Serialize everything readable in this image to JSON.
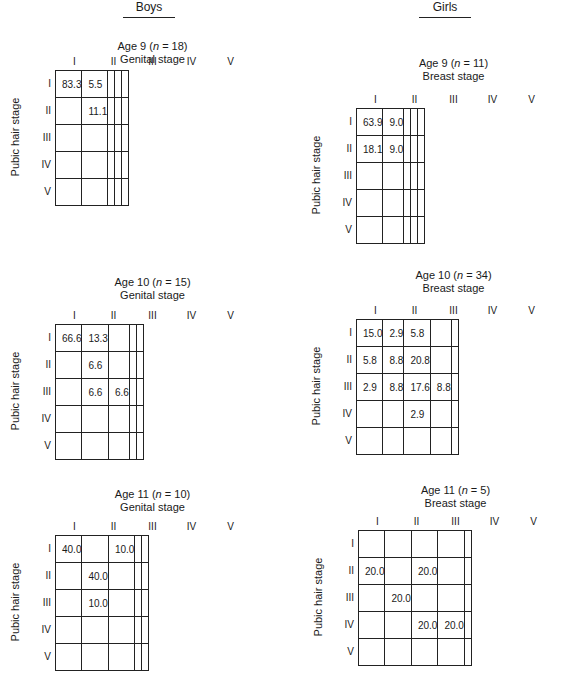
{
  "column_headers": {
    "boys": "Boys",
    "girls": "Girls"
  },
  "chart_data": [
    {
      "type": "table",
      "group": "Boys",
      "title": "Age 9 (n = 18)",
      "subtitle": "Genital stage",
      "xlabel": "Genital stage",
      "ylabel": "Pubic hair stage",
      "col_labels": [
        "I",
        "II",
        "III",
        "IV",
        "V"
      ],
      "row_labels": [
        "I",
        "II",
        "III",
        "IV",
        "V"
      ],
      "cells": [
        [
          "83.3",
          "5.5",
          "",
          "",
          ""
        ],
        [
          "",
          "11.1",
          "",
          "",
          ""
        ],
        [
          "",
          "",
          "",
          "",
          ""
        ],
        [
          "",
          "",
          "",
          "",
          ""
        ],
        [
          "",
          "",
          "",
          "",
          ""
        ]
      ]
    },
    {
      "type": "table",
      "group": "Girls",
      "title": "Age 9 (n = 11)",
      "subtitle": "Breast stage",
      "xlabel": "Breast stage",
      "ylabel": "Pubic hair stage",
      "col_labels": [
        "I",
        "II",
        "III",
        "IV",
        "V"
      ],
      "row_labels": [
        "I",
        "II",
        "III",
        "IV",
        "V"
      ],
      "cells": [
        [
          "63.9",
          "9.0",
          "",
          "",
          ""
        ],
        [
          "18.1",
          "9.0",
          "",
          "",
          ""
        ],
        [
          "",
          "",
          "",
          "",
          ""
        ],
        [
          "",
          "",
          "",
          "",
          ""
        ],
        [
          "",
          "",
          "",
          "",
          ""
        ]
      ]
    },
    {
      "type": "table",
      "group": "Boys",
      "title": "Age 10 (n = 15)",
      "subtitle": "Genital stage",
      "xlabel": "Genital stage",
      "ylabel": "Pubic hair stage",
      "col_labels": [
        "I",
        "II",
        "III",
        "IV",
        "V"
      ],
      "row_labels": [
        "I",
        "II",
        "III",
        "IV",
        "V"
      ],
      "cells": [
        [
          "66.6",
          "13.3",
          "",
          "",
          ""
        ],
        [
          "",
          "6.6",
          "",
          "",
          ""
        ],
        [
          "",
          "6.6",
          "6.6",
          "",
          ""
        ],
        [
          "",
          "",
          "",
          "",
          ""
        ],
        [
          "",
          "",
          "",
          "",
          ""
        ]
      ]
    },
    {
      "type": "table",
      "group": "Girls",
      "title": "Age 10 (n = 34)",
      "subtitle": "Breast stage",
      "xlabel": "Breast stage",
      "ylabel": "Pubic hair stage",
      "col_labels": [
        "I",
        "II",
        "III",
        "IV",
        "V"
      ],
      "row_labels": [
        "I",
        "II",
        "III",
        "IV",
        "V"
      ],
      "cells": [
        [
          "15.0",
          "2.9",
          "5.8",
          "",
          ""
        ],
        [
          "5.8",
          "8.8",
          "20.8",
          "",
          ""
        ],
        [
          "2.9",
          "8.8",
          "17.6",
          "8.8",
          ""
        ],
        [
          "",
          "",
          "2.9",
          "",
          ""
        ],
        [
          "",
          "",
          "",
          "",
          ""
        ]
      ]
    },
    {
      "type": "table",
      "group": "Boys",
      "title": "Age 11 (n = 10)",
      "subtitle": "Genital stage",
      "xlabel": "Genital stage",
      "ylabel": "Pubic hair stage",
      "col_labels": [
        "I",
        "II",
        "III",
        "IV",
        "V"
      ],
      "row_labels": [
        "I",
        "II",
        "III",
        "IV",
        "V"
      ],
      "cells": [
        [
          "40.0",
          "",
          "10.0",
          "",
          ""
        ],
        [
          "",
          "40.0",
          "",
          "",
          ""
        ],
        [
          "",
          "10.0",
          "",
          "",
          ""
        ],
        [
          "",
          "",
          "",
          "",
          ""
        ],
        [
          "",
          "",
          "",
          "",
          ""
        ]
      ]
    },
    {
      "type": "table",
      "group": "Girls",
      "title": "Age 11 (n = 5)",
      "subtitle": "Breast stage",
      "xlabel": "Breast stage",
      "ylabel": "Pubic hair stage",
      "col_labels": [
        "I",
        "II",
        "III",
        "IV",
        "V"
      ],
      "row_labels": [
        "I",
        "II",
        "III",
        "IV",
        "V"
      ],
      "cells": [
        [
          "",
          "",
          "",
          "",
          ""
        ],
        [
          "20.0",
          "",
          "20.0",
          "",
          ""
        ],
        [
          "",
          "20.0",
          "",
          "",
          ""
        ],
        [
          "",
          "",
          "20.0",
          "20.0",
          ""
        ],
        [
          "",
          "",
          "",
          "",
          ""
        ]
      ]
    }
  ]
}
